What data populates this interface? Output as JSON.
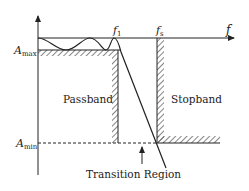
{
  "diagram": {
    "type": "filter-specification",
    "axis": {
      "x_label": "f",
      "y_arrow": true
    },
    "levels": {
      "a_max": {
        "base": "A",
        "sub": "max"
      },
      "a_min": {
        "base": "A",
        "sub": "min"
      }
    },
    "frequencies": {
      "f1": {
        "base": "f",
        "sub": "1"
      },
      "fs": {
        "base": "f",
        "sub": "s"
      }
    },
    "regions": {
      "passband": "Passband",
      "stopband": "Stopband",
      "transition": "Transition Region"
    },
    "colors": {
      "line": "#222222",
      "background": "#ffffff"
    }
  }
}
